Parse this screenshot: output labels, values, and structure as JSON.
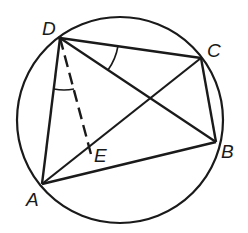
{
  "diagram": {
    "type": "inscribed-quadrilateral",
    "circle": {
      "cx": 120,
      "cy": 120,
      "r": 103
    },
    "points": {
      "A": {
        "label": "A",
        "x": 42,
        "y": 184
      },
      "B": {
        "label": "B",
        "x": 216,
        "y": 142
      },
      "C": {
        "label": "C",
        "x": 201,
        "y": 58
      },
      "D": {
        "label": "D",
        "x": 60,
        "y": 38
      },
      "E": {
        "label": "E",
        "x": 92,
        "y": 158
      }
    },
    "segments": [
      "DC",
      "CB",
      "BA",
      "AD",
      "DB",
      "AC",
      "DE (dashed)"
    ],
    "angle_marks": [
      "angle BDC at D",
      "angle ADE at D"
    ],
    "stroke_color": "#1a1a1a"
  }
}
